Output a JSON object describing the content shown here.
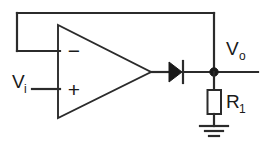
{
  "diagram": {
    "background_color": "#ffffff",
    "line_color": "#2b2b2b",
    "fill_color": "#1a1a1a"
  },
  "labels": {
    "input_voltage": "V",
    "input_voltage_sub": "i",
    "output_voltage": "V",
    "output_voltage_sub": "o",
    "resistor": "R",
    "resistor_sub": "1",
    "inverting_sign": "−",
    "noninverting_sign": "+"
  },
  "components": {
    "opamp": {
      "name": "operational-amplifier",
      "shape": "triangle",
      "inverting_input_label": "−",
      "noninverting_input_label": "+"
    },
    "diode": {
      "name": "diode",
      "orientation": "anode-left-cathode-right"
    },
    "resistor": {
      "name": "load-resistor",
      "label": "R1",
      "style": "rectangular-box"
    },
    "ground": {
      "name": "ground",
      "style": "three-bar-earth"
    },
    "output_node": {
      "name": "output-junction",
      "style": "filled-dot"
    },
    "feedback_wire": {
      "name": "feedback-path",
      "description": "output tied back to inverting input"
    }
  },
  "geometry": {
    "canvas_width": 265,
    "canvas_height": 146,
    "top_rail_y": 13,
    "signal_y": 72,
    "feedback_left_x": 17,
    "feedback_stub_y": 50,
    "opamp_left_x": 58,
    "opamp_top_y": 25,
    "opamp_bottom_y": 118,
    "opamp_apex_x": 151,
    "node_x": 214,
    "output_right_x": 258,
    "input_left_x": 32,
    "plus_input_y": 89
  }
}
